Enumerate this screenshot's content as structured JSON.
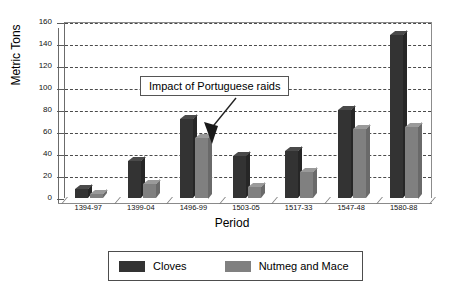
{
  "chart_data": {
    "type": "bar",
    "title": "",
    "xlabel": "Period",
    "ylabel": "Metric Tons",
    "ylim": [
      0,
      160
    ],
    "ytick_step": 20,
    "yticks": [
      0,
      20,
      40,
      60,
      80,
      100,
      120,
      140,
      160
    ],
    "grid": true,
    "legend_position": "bottom",
    "categories": [
      "1394-97",
      "1399-04",
      "1496-99",
      "1503-05",
      "1517-33",
      "1547-48",
      "1580-88"
    ],
    "series": [
      {
        "name": "Cloves",
        "color": "#333333",
        "values": [
          8,
          34,
          72,
          38,
          43,
          80,
          148
        ]
      },
      {
        "name": "Nutmeg and Mace",
        "color": "#808080",
        "values": [
          4,
          13,
          55,
          10,
          24,
          63,
          65
        ]
      }
    ],
    "annotations": [
      {
        "text": "Impact of Portuguese raids",
        "points_to_category": "1503-05"
      }
    ]
  },
  "axes": {
    "y_title": "Metric Tons",
    "x_title": "Period",
    "y_tick_labels": [
      "0",
      "20",
      "40",
      "60",
      "80",
      "100",
      "120",
      "140",
      "160"
    ],
    "x_tick_labels": [
      "1394-97",
      "1399-04",
      "1496-99",
      "1503-05",
      "1517-33",
      "1547-48",
      "1580-88"
    ]
  },
  "annotation": {
    "text": "Impact of Portuguese raids"
  },
  "legend": {
    "items": [
      {
        "label": "Cloves",
        "color": "#333333"
      },
      {
        "label": "Nutmeg and Mace",
        "color": "#808080"
      }
    ]
  }
}
